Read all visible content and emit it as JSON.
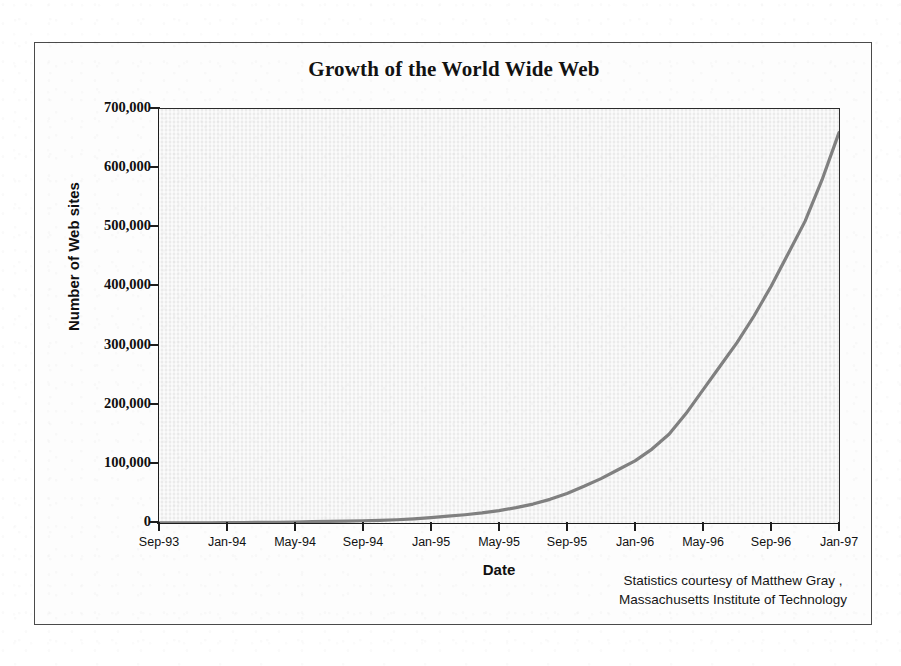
{
  "figure": {
    "title": "Growth of the World Wide Web",
    "credit_line_1": "Statistics courtesy of Matthew Gray ,",
    "credit_line_2": "Massachusetts Institute of Technology",
    "line_color": "#808080",
    "plot_background": "#f1f1f1",
    "axis_color": "#1d1d1d",
    "frame_color": "#4a4a4a"
  },
  "chart_data": {
    "type": "line",
    "title": "Growth of the World Wide Web",
    "xlabel": "Date",
    "ylabel": "Number of Web sites",
    "xlim": [
      "Sep-93",
      "Jan-97"
    ],
    "ylim": [
      0,
      700000
    ],
    "grid": false,
    "legend": null,
    "annotations": [
      "Statistics courtesy of Matthew Gray ,",
      "Massachusetts Institute of Technology"
    ],
    "ytick_labels": [
      "0",
      "100,000",
      "200,000",
      "300,000",
      "400,000",
      "500,000",
      "600,000",
      "700,000"
    ],
    "ytick_values": [
      0,
      100000,
      200000,
      300000,
      400000,
      500000,
      600000,
      700000
    ],
    "xtick_labels": [
      "Sep-93",
      "Jan-94",
      "May-94",
      "Sep-94",
      "Jan-95",
      "May-95",
      "Sep-95",
      "Jan-96",
      "May-96",
      "Sep-96",
      "Jan-97"
    ],
    "x": [
      "Sep-93",
      "Oct-93",
      "Nov-93",
      "Dec-93",
      "Jan-94",
      "Feb-94",
      "Mar-94",
      "Apr-94",
      "May-94",
      "Jun-94",
      "Jul-94",
      "Aug-94",
      "Sep-94",
      "Oct-94",
      "Nov-94",
      "Dec-94",
      "Jan-95",
      "Feb-95",
      "Mar-95",
      "Apr-95",
      "May-95",
      "Jun-95",
      "Jul-95",
      "Aug-95",
      "Sep-95",
      "Oct-95",
      "Nov-95",
      "Dec-95",
      "Jan-96",
      "Feb-96",
      "Mar-96",
      "Apr-96",
      "May-96",
      "Jun-96",
      "Jul-96",
      "Aug-96",
      "Sep-96",
      "Oct-96",
      "Nov-96",
      "Dec-96",
      "Jan-97"
    ],
    "values": [
      200,
      260,
      330,
      430,
      620,
      800,
      1000,
      1300,
      1700,
      2200,
      2700,
      3200,
      3800,
      4500,
      5500,
      7000,
      9000,
      11500,
      14000,
      17000,
      21000,
      26000,
      32000,
      40000,
      50000,
      62000,
      75000,
      90000,
      105000,
      125000,
      150000,
      185000,
      225000,
      265000,
      305000,
      350000,
      400000,
      455000,
      510000,
      580000,
      660000
    ]
  }
}
